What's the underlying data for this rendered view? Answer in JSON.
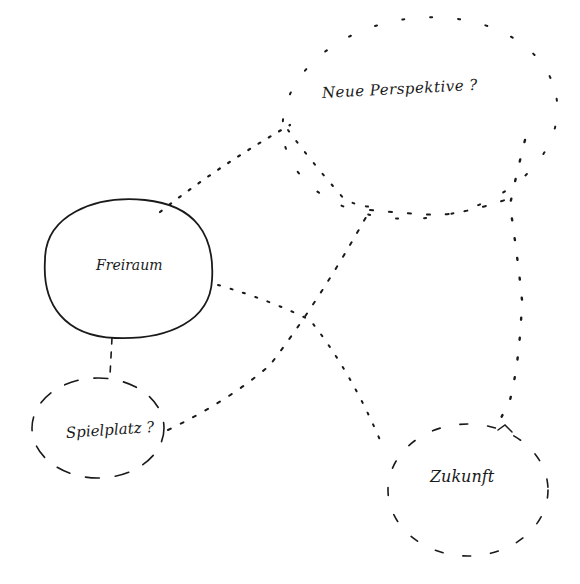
{
  "diagram": {
    "style": "hand-drawn sketch",
    "background": "#ffffff",
    "ink_color": "#1a1a1a",
    "nodes": [
      {
        "id": "neue-perspektive",
        "label": "Neue Perspektive ?",
        "border": "dotted",
        "cx": 420,
        "cy": 115,
        "rx": 140,
        "ry": 100
      },
      {
        "id": "freiraum",
        "label": "Freiraum",
        "border": "solid",
        "cx": 127,
        "cy": 269,
        "rx": 88,
        "ry": 76
      },
      {
        "id": "spielplatz",
        "label": "Spielplatz ?",
        "border": "dashed",
        "cx": 98,
        "cy": 425,
        "rx": 66,
        "ry": 50
      },
      {
        "id": "zukunft",
        "label": "Zukunft",
        "border": "dashed",
        "cx": 470,
        "cy": 487,
        "rx": 80,
        "ry": 65
      }
    ],
    "edges": [
      {
        "from": "freiraum",
        "to": "neue-perspektive",
        "style": "dotted"
      },
      {
        "from": "freiraum",
        "to": "zukunft",
        "style": "dotted"
      },
      {
        "from": "freiraum",
        "to": "spielplatz",
        "style": "dashed"
      },
      {
        "from": "spielplatz",
        "to": "neue-perspektive",
        "style": "dotted"
      },
      {
        "from": "neue-perspektive",
        "to": "zukunft",
        "style": "dotted"
      }
    ]
  }
}
